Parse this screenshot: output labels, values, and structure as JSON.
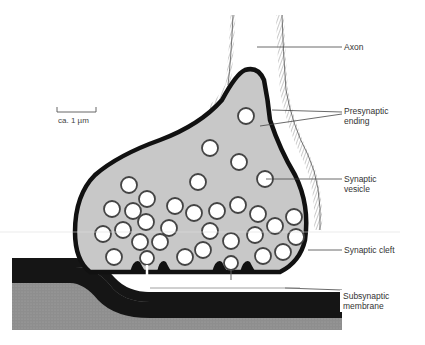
{
  "diagram": {
    "scale_bar": {
      "label": "ca. 1 µm"
    },
    "labels": {
      "axon": "Axon",
      "presynaptic_line1": "Presynaptic",
      "presynaptic_line2": "ending",
      "vesicle_line1": "Synaptic",
      "vesicle_line2": "vesicle",
      "cleft": "Synaptic cleft",
      "subsynaptic_line1": "Subsynaptic",
      "subsynaptic_line2": "membrane"
    },
    "colors": {
      "cytoplasm": "#c8c8c8",
      "membrane": "#111111",
      "postsynaptic": "#8f8f8f",
      "vesicle_fill": "#ffffff",
      "vesicle_stroke": "#444444"
    }
  }
}
